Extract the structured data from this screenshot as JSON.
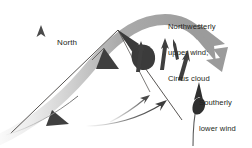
{
  "diagram": {
    "background_color": "#ffffff",
    "labels": {
      "north": "North",
      "upper_wind_line1": "Northwesterly",
      "upper_wind_line2": "upper wind;",
      "upper_wind_line3": "Cirrus cloud",
      "lower_wind_line1": "Southerly",
      "lower_wind_line2": "lower wind"
    },
    "colors": {
      "text": "#231f20",
      "band_dark": "#9b9b9b",
      "band_light": "#e8e8e8",
      "mountain_outline": "#3a3a3a",
      "mountain_shadow": "#4a4a4a",
      "streamline": "#4a4a4a",
      "north_arrow": "#555555"
    },
    "elements": [
      {
        "name": "north-arrow",
        "kind": "arrow",
        "direction": "up"
      },
      {
        "name": "mountain",
        "kind": "shape"
      },
      {
        "name": "upper-wind-band",
        "kind": "band",
        "direction": "left-to-right-over-peak"
      },
      {
        "name": "upper-wind-band-arrowhead",
        "kind": "arrowhead",
        "direction": "down-right"
      },
      {
        "name": "streamline-upper-1",
        "kind": "streamline",
        "direction": "up"
      },
      {
        "name": "streamline-upper-2",
        "kind": "streamline",
        "direction": "up"
      },
      {
        "name": "streamline-upper-3",
        "kind": "streamline",
        "direction": "up"
      },
      {
        "name": "streamline-peak",
        "kind": "streamline",
        "direction": "up-left"
      },
      {
        "name": "streamline-slope",
        "kind": "streamline",
        "direction": "up-right"
      },
      {
        "name": "streamline-valley",
        "kind": "streamline",
        "direction": "up-right"
      },
      {
        "name": "streamline-lower-wind",
        "kind": "streamline",
        "direction": "up"
      }
    ]
  }
}
